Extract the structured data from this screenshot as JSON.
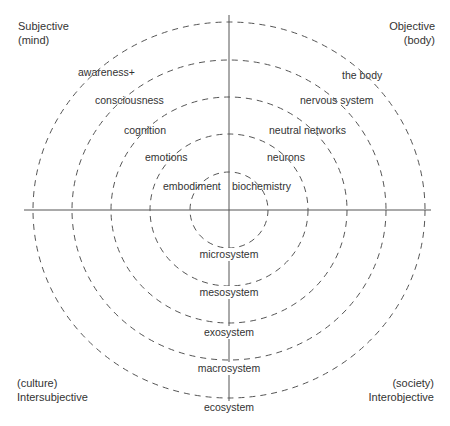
{
  "diagram": {
    "type": "concentric-quadrant",
    "colors": {
      "lines": "#555555",
      "text": "#333333",
      "background": "#ffffff"
    },
    "quadrants": {
      "top_left": {
        "line1": "Subjective",
        "line2": "(mind)"
      },
      "top_right": {
        "line1": "Objective",
        "line2": "(body)"
      },
      "bottom_left": {
        "line1": "(culture)",
        "line2": "Intersubjective"
      },
      "bottom_right": {
        "line1": "(society)",
        "line2": "Interobjective"
      }
    },
    "rings_count": 5,
    "subjective_levels": [
      "embodiment",
      "emotions",
      "cognition",
      "consciousness",
      "awareness+"
    ],
    "objective_levels": [
      "biochemistry",
      "neurons",
      "neutral networks",
      "nervous system",
      "the body"
    ],
    "systems_levels": [
      "microsystem",
      "mesosystem",
      "exosystem",
      "macrosystem",
      "ecosystem"
    ]
  }
}
